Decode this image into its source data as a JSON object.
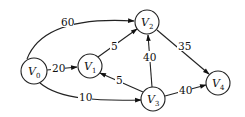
{
  "graph": {
    "type": "directed-weighted-graph",
    "nodes": [
      {
        "id": "V0",
        "label": "V",
        "sub": "0",
        "x": 34,
        "y": 71,
        "r": 13
      },
      {
        "id": "V1",
        "label": "V",
        "sub": "1",
        "x": 90,
        "y": 66,
        "r": 12
      },
      {
        "id": "V2",
        "label": "V",
        "sub": "2",
        "x": 147,
        "y": 22,
        "r": 12
      },
      {
        "id": "V3",
        "label": "V",
        "sub": "3",
        "x": 153,
        "y": 99,
        "r": 12
      },
      {
        "id": "V4",
        "label": "V",
        "sub": "4",
        "x": 218,
        "y": 83,
        "r": 12
      }
    ],
    "edges": [
      {
        "from": "V0",
        "to": "V2",
        "weight": "60"
      },
      {
        "from": "V0",
        "to": "V1",
        "weight": "20"
      },
      {
        "from": "V0",
        "to": "V3",
        "weight": "10"
      },
      {
        "from": "V1",
        "to": "V2",
        "weight": "5"
      },
      {
        "from": "V3",
        "to": "V1",
        "weight": "5"
      },
      {
        "from": "V3",
        "to": "V2",
        "weight": "40"
      },
      {
        "from": "V2",
        "to": "V4",
        "weight": "35"
      },
      {
        "from": "V3",
        "to": "V4",
        "weight": "40"
      }
    ]
  }
}
